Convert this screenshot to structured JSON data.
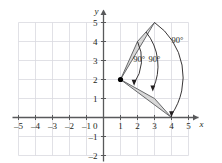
{
  "figure": {
    "type": "coordinate-plane-rotation-diagram",
    "background_color": "#ffffff",
    "grid_color": "#d9d9e0",
    "axis_color": "#58595b",
    "shape_fill": "#d8d8d8",
    "shape_stroke": "#58595b",
    "arc_color": "#231f20",
    "text_color": "#231f20"
  },
  "axes": {
    "x_label": "x",
    "y_label": "y",
    "x_min": -5,
    "x_max": 5,
    "y_min": -2,
    "y_max": 5,
    "origin_label": "0",
    "x_ticks": [
      "–5",
      "–4",
      "–3",
      "–2",
      "–1",
      "1",
      "2",
      "3",
      "4",
      "5"
    ],
    "x_tick_values": [
      -5,
      -4,
      -3,
      -2,
      -1,
      1,
      2,
      3,
      4,
      5
    ],
    "y_ticks": [
      "5",
      "4",
      "3",
      "2",
      "1",
      "–1",
      "–2"
    ],
    "y_tick_values": [
      5,
      4,
      3,
      2,
      1,
      -1,
      -2
    ]
  },
  "chart_data": {
    "type": "scatter",
    "title": "",
    "xlabel": "x",
    "ylabel": "y",
    "xlim": [
      -5,
      5
    ],
    "ylim": [
      -2,
      5
    ],
    "grid": true,
    "center_of_rotation": {
      "label": "center",
      "x": 1,
      "y": 2
    },
    "shapes": [
      {
        "name": "preimage-triangle",
        "vertices": [
          [
            1,
            2
          ],
          [
            2,
            4
          ],
          [
            3,
            5
          ]
        ],
        "fill": "#d8d8d8"
      },
      {
        "name": "image-triangle",
        "vertices": [
          [
            1,
            2
          ],
          [
            3,
            1
          ],
          [
            4,
            0
          ]
        ],
        "fill": "#d8d8d8"
      }
    ],
    "arcs": [
      {
        "name": "arc-inner",
        "label": "90°",
        "from": [
          2,
          4
        ],
        "to": [
          1.8,
          1.8
        ],
        "label_x": 2.1,
        "label_y": 2.9
      },
      {
        "name": "arc-middle",
        "label": "90°",
        "from": [
          2.5,
          4.5
        ],
        "to": [
          2.9,
          1.5
        ],
        "label_x": 3.0,
        "label_y": 2.9
      },
      {
        "name": "arc-outer",
        "label": "90°",
        "from": [
          3,
          5
        ],
        "to": [
          4,
          0.15
        ],
        "label_x": 4.35,
        "label_y": 3.9
      }
    ]
  },
  "labels": {
    "angle_1": "90°",
    "angle_2": "90°",
    "angle_3": "90°"
  }
}
